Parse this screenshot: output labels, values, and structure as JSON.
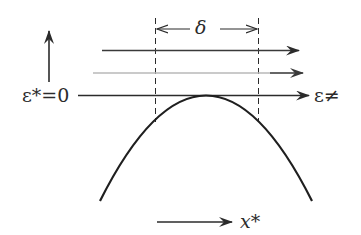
{
  "diagram": {
    "labels": {
      "energy_zero": "ε*=0",
      "energy_axis": "ε≠",
      "width": "δ",
      "coordinate": "x*"
    },
    "colors": {
      "ink": "#2b2b2b",
      "faint_line": "#b8b8b8",
      "background": "#ffffff"
    },
    "elements": [
      "vertical energy arrow (upward)",
      "horizontal arrow above barrier (upper)",
      "horizontal arrow above barrier (faint, middle)",
      "horizontal arrow at barrier top level ε*=0",
      "dashed vertical bounds with δ width marker",
      "inverted parabola barrier",
      "reaction coordinate arrow x*"
    ]
  }
}
